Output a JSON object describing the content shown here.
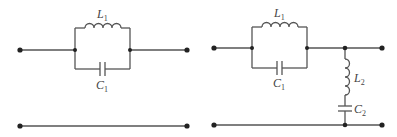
{
  "diagram": {
    "type": "circuit-schematic",
    "circuits": [
      {
        "id": "left",
        "description": "Series parallel-LC (tank) between input and output terminals; plain return rail",
        "components": [
          {
            "name": "L",
            "sub": "1",
            "kind": "inductor",
            "placement": "parallel-branch-top"
          },
          {
            "name": "C",
            "sub": "1",
            "kind": "capacitor",
            "placement": "parallel-branch-bottom"
          }
        ]
      },
      {
        "id": "right",
        "description": "Series parallel-LC tank followed by shunt series-LC to return rail",
        "components": [
          {
            "name": "L",
            "sub": "1",
            "kind": "inductor",
            "placement": "parallel-branch-top"
          },
          {
            "name": "C",
            "sub": "1",
            "kind": "capacitor",
            "placement": "parallel-branch-bottom"
          },
          {
            "name": "L",
            "sub": "2",
            "kind": "inductor",
            "placement": "shunt-branch"
          },
          {
            "name": "C",
            "sub": "2",
            "kind": "capacitor",
            "placement": "shunt-branch"
          }
        ]
      }
    ]
  },
  "labels": {
    "left_L1": {
      "main": "L",
      "sub": "1"
    },
    "left_C1": {
      "main": "C",
      "sub": "1"
    },
    "right_L1": {
      "main": "L",
      "sub": "1"
    },
    "right_C1": {
      "main": "C",
      "sub": "1"
    },
    "right_L2": {
      "main": "L",
      "sub": "2"
    },
    "right_C2": {
      "main": "C",
      "sub": "2"
    }
  }
}
